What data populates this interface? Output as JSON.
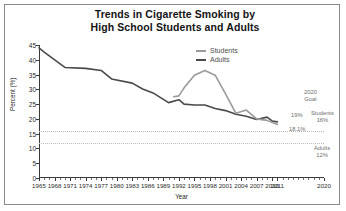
{
  "title": {
    "line1": "Trends in Cigarette Smoking by",
    "line2": "High School Students and Adults"
  },
  "legend": {
    "position": "top-center-right",
    "items": [
      {
        "label": "Students",
        "color": "#9a9a9a"
      },
      {
        "label": "Adults",
        "color": "#4a4a4a"
      }
    ]
  },
  "annotations": {
    "goal_header_line1": "2020",
    "goal_header_line2": "Goal",
    "students_name": "Students",
    "students_goal": "16%",
    "adults_name": "Adults",
    "adults_goal": "12%",
    "students_last_value": "19%",
    "adults_last_value": "18.1%"
  },
  "chart_data": {
    "type": "line",
    "title": "Trends in Cigarette Smoking by High School Students and Adults",
    "xlabel": "Year",
    "ylabel": "Percent (%)",
    "xlim": [
      1965,
      2020
    ],
    "ylim": [
      0,
      45
    ],
    "yticks": [
      0,
      5,
      10,
      15,
      20,
      25,
      30,
      35,
      40,
      45
    ],
    "xticks": [
      1965,
      1968,
      1971,
      1974,
      1977,
      1980,
      1983,
      1986,
      1989,
      1992,
      1995,
      1998,
      2001,
      2004,
      2007,
      2010,
      2011,
      2020
    ],
    "grid": false,
    "goal_lines": [
      {
        "label": "Students 16%",
        "value": 16,
        "style": "dotted"
      },
      {
        "label": "Adults 12%",
        "value": 12,
        "style": "dotted"
      }
    ],
    "series": [
      {
        "name": "Adults",
        "color": "#4a4a4a",
        "x": [
          1965,
          1966,
          1970,
          1974,
          1977,
          1979,
          1983,
          1985,
          1987,
          1990,
          1992,
          1993,
          1995,
          1997,
          1999,
          2001,
          2003,
          2005,
          2007,
          2009,
          2010,
          2011
        ],
        "values": [
          44.0,
          42.6,
          37.4,
          37.1,
          36.4,
          33.5,
          32.1,
          30.1,
          28.8,
          25.5,
          26.5,
          25.0,
          24.7,
          24.7,
          23.5,
          22.8,
          21.6,
          20.9,
          19.8,
          20.6,
          19.3,
          19.0
        ]
      },
      {
        "name": "Students",
        "color": "#9a9a9a",
        "x": [
          1991,
          1992,
          1993,
          1995,
          1997,
          1999,
          2001,
          2003,
          2005,
          2007,
          2009,
          2011
        ],
        "values": [
          27.5,
          27.8,
          30.5,
          34.8,
          36.4,
          34.8,
          28.5,
          21.9,
          23.0,
          20.0,
          19.5,
          18.1
        ]
      }
    ]
  }
}
